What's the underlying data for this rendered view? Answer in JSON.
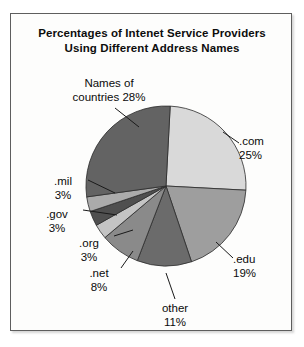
{
  "figure": {
    "title_line1": "Percentages of Intenet Service Providers",
    "title_line2": "Using Different Address Names",
    "frame_border_color": "#5e5e5e",
    "background_color": "#fdfdfc"
  },
  "labels": {
    "countries": "Names of\ncountries 28%",
    "com": ".com\n25%",
    "edu": ".edu\n19%",
    "other": "other\n11%",
    "net": ".net\n8%",
    "org": ".org\n3%",
    "gov": ".gov\n3%",
    "mil": ".mil\n3%"
  },
  "chart_data": {
    "type": "pie",
    "title": "Percentages of Intenet Service Providers Using Different Address Names",
    "xlabel": "",
    "ylabel": "",
    "legend_position": "none",
    "grid": false,
    "start_angle_deg": 0,
    "direction": "clockwise",
    "units": "percent",
    "total": 100,
    "categories": [
      ".com",
      ".edu",
      "other",
      ".net",
      ".org",
      ".gov",
      ".mil",
      "Names of countries"
    ],
    "values": [
      25,
      19,
      11,
      8,
      3,
      3,
      3,
      28
    ],
    "slices": [
      {
        "label": ".com",
        "value": 25,
        "display": "25%",
        "color": "#d9d9d9"
      },
      {
        "label": ".edu",
        "value": 19,
        "display": "19%",
        "color": "#9e9e9e"
      },
      {
        "label": "other",
        "value": 11,
        "display": "11%",
        "color": "#6b6b6b"
      },
      {
        "label": ".net",
        "value": 8,
        "display": "8%",
        "color": "#8a8a8a"
      },
      {
        "label": ".org",
        "value": 3,
        "display": "3%",
        "color": "#c4c4c4"
      },
      {
        "label": ".gov",
        "value": 3,
        "display": "3%",
        "color": "#4f4f4f"
      },
      {
        "label": ".mil",
        "value": 3,
        "display": "3%",
        "color": "#ababab"
      },
      {
        "label": "Names of countries",
        "value": 28,
        "display": "28%",
        "color": "#636363"
      }
    ]
  }
}
